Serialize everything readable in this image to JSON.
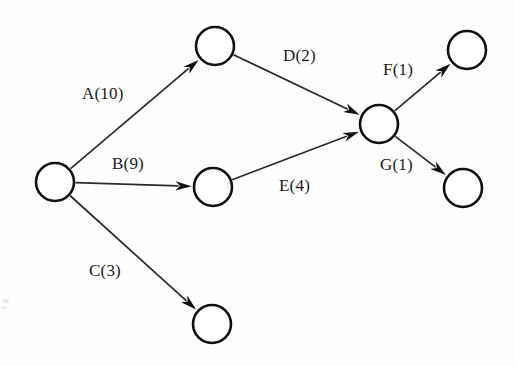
{
  "diagram": {
    "type": "directed-graph",
    "background_color": "#fefefe",
    "node_fill_color": "#ffffff",
    "node_stroke_color": "#111111",
    "edge_color": "#2a2a2a",
    "label_color": "#1a1a1a",
    "node_radius": 19,
    "nodes": [
      {
        "id": "n1",
        "name": "start-node",
        "cx": 55,
        "cy": 182
      },
      {
        "id": "n2",
        "name": "upper-middle-node",
        "cx": 215,
        "cy": 46
      },
      {
        "id": "n3",
        "name": "center-middle-node",
        "cx": 213,
        "cy": 187
      },
      {
        "id": "n4",
        "name": "lower-middle-node",
        "cx": 212,
        "cy": 324
      },
      {
        "id": "n5",
        "name": "hub-node",
        "cx": 379,
        "cy": 124
      },
      {
        "id": "n6",
        "name": "upper-right-node",
        "cx": 467,
        "cy": 50
      },
      {
        "id": "n7",
        "name": "lower-right-node",
        "cx": 463,
        "cy": 188
      }
    ],
    "edges": [
      {
        "id": "e1",
        "name": "edge-a",
        "from": "n1",
        "to": "n2",
        "label": "A(10)",
        "activity": "A",
        "weight": 10,
        "label_x": 82,
        "label_y": 85
      },
      {
        "id": "e2",
        "name": "edge-b",
        "from": "n1",
        "to": "n3",
        "label": "B(9)",
        "activity": "B",
        "weight": 9,
        "label_x": 112,
        "label_y": 155
      },
      {
        "id": "e3",
        "name": "edge-c",
        "from": "n1",
        "to": "n4",
        "label": "C(3)",
        "activity": "C",
        "weight": 3,
        "label_x": 89,
        "label_y": 262
      },
      {
        "id": "e4",
        "name": "edge-d",
        "from": "n2",
        "to": "n5",
        "label": "D(2)",
        "activity": "D",
        "weight": 2,
        "label_x": 283,
        "label_y": 47
      },
      {
        "id": "e5",
        "name": "edge-e",
        "from": "n3",
        "to": "n5",
        "label": "E(4)",
        "activity": "E",
        "weight": 4,
        "label_x": 279,
        "label_y": 177
      },
      {
        "id": "e6",
        "name": "edge-f",
        "from": "n5",
        "to": "n6",
        "label": "F(1)",
        "activity": "F",
        "weight": 1,
        "label_x": 383,
        "label_y": 61
      },
      {
        "id": "e7",
        "name": "edge-g",
        "from": "n5",
        "to": "n7",
        "label": "G(1)",
        "activity": "G",
        "weight": 1,
        "label_x": 380,
        "label_y": 156
      }
    ]
  }
}
